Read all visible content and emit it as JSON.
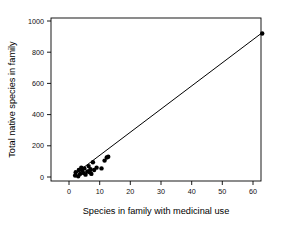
{
  "figure": {
    "background_color": "#ffffff",
    "foreground_color": "#000000"
  },
  "chart_data": {
    "type": "scatter",
    "title": "",
    "subtitle": "",
    "xlabel": "Species in family with medicinal use",
    "ylabel": "Total native species in family",
    "xlim": [
      -2.5,
      65.5
    ],
    "ylim": [
      -70,
      1055
    ],
    "xticks": [
      0,
      10,
      20,
      30,
      40,
      50,
      60
    ],
    "xticklabels": [
      "0",
      "10",
      "20",
      "30",
      "40",
      "50",
      "60"
    ],
    "yticks": [
      0,
      200,
      400,
      600,
      800,
      1000
    ],
    "yticklabels": [
      "0",
      "200",
      "400",
      "600",
      "800",
      "1000"
    ],
    "grid": false,
    "legend": null,
    "legend_position": "none",
    "marker": "filled-circle",
    "marker_size": 4.4,
    "marker_color": "#000000",
    "series": [
      {
        "name": "families",
        "points": [
          [
            2.0,
            10
          ],
          [
            2.2,
            30
          ],
          [
            3.0,
            5
          ],
          [
            3.2,
            45
          ],
          [
            3.6,
            20
          ],
          [
            4.0,
            60
          ],
          [
            4.3,
            40
          ],
          [
            4.8,
            25
          ],
          [
            5.0,
            55
          ],
          [
            5.4,
            15
          ],
          [
            6.0,
            35
          ],
          [
            6.4,
            70
          ],
          [
            6.8,
            30
          ],
          [
            7.0,
            50
          ],
          [
            7.3,
            20
          ],
          [
            7.8,
            95
          ],
          [
            8.2,
            45
          ],
          [
            9.0,
            60
          ],
          [
            10.6,
            55
          ],
          [
            11.6,
            105
          ],
          [
            12.3,
            125
          ],
          [
            12.8,
            130
          ],
          [
            63.0,
            920
          ]
        ]
      }
    ],
    "fit_line": {
      "name": "linear fit",
      "x": [
        2.0,
        63.0
      ],
      "y": [
        20,
        925
      ],
      "color": "#000000",
      "width": 1.0
    }
  },
  "axes": {
    "x_axis_name": "x-axis",
    "y_axis_name": "y-axis",
    "frame": "box"
  }
}
